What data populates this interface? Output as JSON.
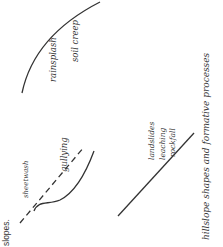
{
  "caption_fragment": "slopes.",
  "diagram": {
    "title": "hillslope shapes and formative processes",
    "slopes": [
      {
        "id": "convex",
        "shape": "convex curve",
        "labels": [
          "rainsplash",
          "soil creep"
        ]
      },
      {
        "id": "straight",
        "shape": "straight line",
        "labels": [
          "landslides",
          "leaching",
          "rockfall"
        ]
      },
      {
        "id": "concave",
        "shape": "concave curve with dashed original profile",
        "labels": [
          "sheetwash",
          "gullying"
        ]
      }
    ]
  },
  "colors": {
    "ink": "#3a3a3a",
    "background": "#ffffff"
  }
}
